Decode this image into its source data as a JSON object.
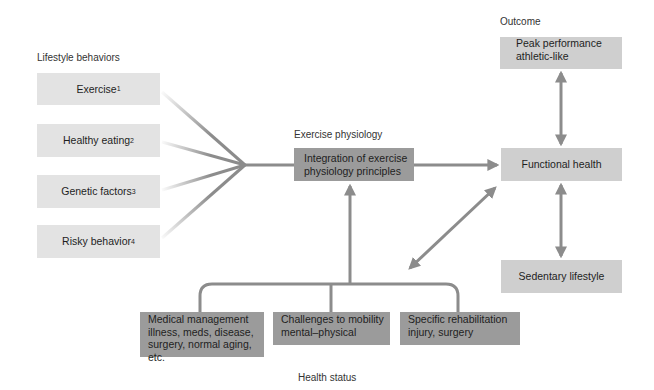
{
  "sections": {
    "lifestyle": "Lifestyle behaviors",
    "physiology": "Exercise physiology",
    "outcome": "Outcome",
    "health": "Health status"
  },
  "lifestyle_items": [
    {
      "label": "Exercise",
      "sup": "1"
    },
    {
      "label": "Healthy eating",
      "sup": "2"
    },
    {
      "label": "Genetic factors",
      "sup": "3"
    },
    {
      "label": "Risky behavior",
      "sup": "4"
    }
  ],
  "physiology_box": {
    "line1": "Integration of exercise",
    "line2": "physiology principles"
  },
  "outcomes": {
    "peak": {
      "line1": "Peak performance",
      "line2": "athletic-like"
    },
    "functional": "Functional health",
    "sedentary": "Sedentary lifestyle"
  },
  "health_items": [
    {
      "line1": "Medical management",
      "line2": "illness, meds, disease,",
      "line3": "surgery, normal aging, etc."
    },
    {
      "line1": "Challenges to mobility",
      "line2": "mental–physical"
    },
    {
      "line1": "Specific rehabilitation",
      "line2": "injury, surgery"
    }
  ],
  "colors": {
    "arrow": "#8c8c8c",
    "box_light": "#e3e3e3",
    "box_mid": "#cfcfcf",
    "box_dark": "#9b9b9b"
  }
}
